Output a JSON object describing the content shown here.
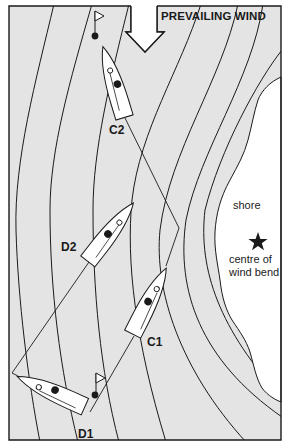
{
  "diagram": {
    "title": "PREVAILING WIND",
    "colors": {
      "water": "#e4e4e4",
      "land": "#ffffff",
      "ink": "#1a1a1a",
      "boat_hull": "#ffffff"
    },
    "wind_arrow": {
      "direction": "down",
      "label": "PREVAILING WIND"
    },
    "boats": [
      {
        "id": "C2",
        "label": "C2",
        "team": "C",
        "position": 2
      },
      {
        "id": "D2",
        "label": "D2",
        "team": "D",
        "position": 2
      },
      {
        "id": "C1",
        "label": "C1",
        "team": "C",
        "position": 1
      },
      {
        "id": "D1",
        "label": "D1",
        "team": "D",
        "position": 1
      }
    ],
    "marks": [
      {
        "id": "top-mark",
        "type": "flag-buoy"
      },
      {
        "id": "bottom-mark",
        "type": "flag-buoy"
      }
    ],
    "shore": {
      "label": "shore",
      "wind_bend_label_line1": "centre of",
      "wind_bend_label_line2": "wind bend",
      "marker": "star"
    }
  }
}
